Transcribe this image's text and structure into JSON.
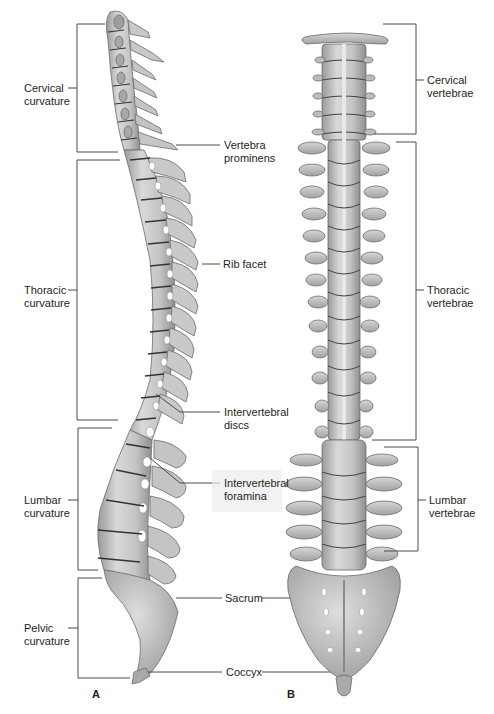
{
  "figure": {
    "panels": [
      {
        "id": "A",
        "label": "A",
        "view": "lateral"
      },
      {
        "id": "B",
        "label": "B",
        "view": "posterior"
      }
    ],
    "colors": {
      "bone_light": "#d8d8d8",
      "bone_mid": "#b9b9b9",
      "bone_dark": "#8d8d8d",
      "outline": "#5e5e5e",
      "leader_line": "#4a4a4a",
      "text": "#231f20",
      "background": "#ffffff"
    }
  },
  "left_brackets": [
    {
      "id": "cervical",
      "line1": "Cervical",
      "line2": "curvature",
      "top": 24,
      "bottom": 152
    },
    {
      "id": "thoracic",
      "line1": "Thoracic",
      "line2": "curvature",
      "top": 160,
      "bottom": 420
    },
    {
      "id": "lumbar",
      "line1": "Lumbar",
      "line2": "curvature",
      "top": 428,
      "bottom": 570
    },
    {
      "id": "pelvic",
      "line1": "Pelvic",
      "line2": "curvature",
      "top": 578,
      "bottom": 678
    }
  ],
  "middle_labels": [
    {
      "id": "vertebra-prominens",
      "line1": "Vertebra",
      "line2": "prominens"
    },
    {
      "id": "rib-facet",
      "line1": "Rib facet",
      "line2": ""
    },
    {
      "id": "intervertebral-discs",
      "line1": "Intervertebral",
      "line2": "discs"
    },
    {
      "id": "intervertebral-foramina",
      "line1": "Intervertebral",
      "line2": "foramina"
    },
    {
      "id": "sacrum",
      "line1": "Sacrum",
      "line2": ""
    },
    {
      "id": "coccyx",
      "line1": "Coccyx",
      "line2": ""
    }
  ],
  "right_brackets": [
    {
      "id": "cervical-vertebrae",
      "line1": "Cervical",
      "line2": "vertebrae",
      "top": 24,
      "bottom": 134
    },
    {
      "id": "thoracic-vertebrae",
      "line1": "Thoracic",
      "line2": "vertebrae",
      "top": 142,
      "bottom": 440
    },
    {
      "id": "lumbar-vertebrae",
      "line1": "Lumbar",
      "line2": "vertebrae",
      "top": 447,
      "bottom": 551
    }
  ]
}
